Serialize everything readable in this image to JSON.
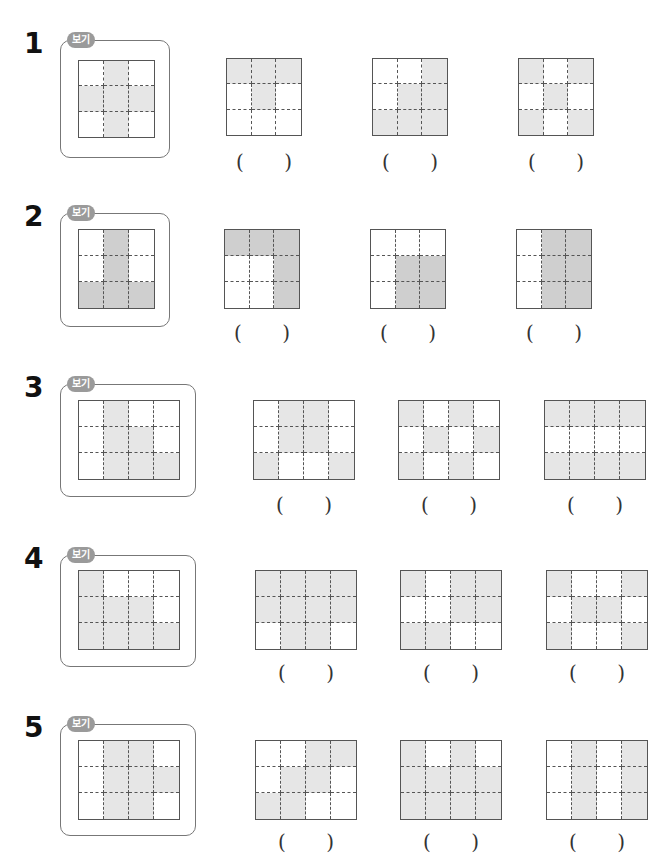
{
  "badge_label": "보기",
  "paren_open": "(",
  "paren_close": ")",
  "shade_color": "#e6e6e6",
  "shade_color_dark": "#cfcfcf",
  "problems": [
    {
      "number": "1",
      "rows": 3,
      "cols": 3,
      "example": [
        [
          0,
          1,
          0
        ],
        [
          1,
          1,
          1
        ],
        [
          0,
          1,
          0
        ]
      ],
      "options": [
        [
          [
            1,
            1,
            1
          ],
          [
            0,
            1,
            0
          ],
          [
            0,
            0,
            0
          ]
        ],
        [
          [
            0,
            0,
            1
          ],
          [
            0,
            1,
            1
          ],
          [
            1,
            1,
            1
          ]
        ],
        [
          [
            1,
            0,
            1
          ],
          [
            0,
            1,
            0
          ],
          [
            1,
            0,
            1
          ]
        ]
      ],
      "answers": [
        "",
        "",
        ""
      ]
    },
    {
      "number": "2",
      "rows": 3,
      "cols": 3,
      "example": [
        [
          0,
          1,
          0
        ],
        [
          0,
          1,
          0
        ],
        [
          1,
          1,
          1
        ]
      ],
      "options": [
        [
          [
            1,
            1,
            1
          ],
          [
            0,
            0,
            1
          ],
          [
            0,
            0,
            1
          ]
        ],
        [
          [
            0,
            0,
            0
          ],
          [
            0,
            1,
            1
          ],
          [
            0,
            1,
            1
          ]
        ],
        [
          [
            0,
            1,
            1
          ],
          [
            0,
            1,
            1
          ],
          [
            0,
            1,
            1
          ]
        ]
      ],
      "answers": [
        "",
        "",
        ""
      ]
    },
    {
      "number": "3",
      "rows": 3,
      "cols": 4,
      "example": [
        [
          0,
          1,
          0,
          0
        ],
        [
          0,
          1,
          1,
          0
        ],
        [
          0,
          1,
          1,
          1
        ]
      ],
      "options": [
        [
          [
            0,
            1,
            1,
            0
          ],
          [
            0,
            1,
            1,
            0
          ],
          [
            1,
            0,
            0,
            1
          ]
        ],
        [
          [
            1,
            0,
            1,
            0
          ],
          [
            0,
            1,
            0,
            1
          ],
          [
            1,
            0,
            1,
            0
          ]
        ],
        [
          [
            1,
            1,
            1,
            1
          ],
          [
            0,
            0,
            0,
            0
          ],
          [
            1,
            1,
            1,
            1
          ]
        ]
      ],
      "answers": [
        "",
        "",
        ""
      ]
    },
    {
      "number": "4",
      "rows": 3,
      "cols": 4,
      "example": [
        [
          1,
          0,
          0,
          0
        ],
        [
          1,
          1,
          1,
          0
        ],
        [
          1,
          1,
          1,
          1
        ]
      ],
      "options": [
        [
          [
            1,
            1,
            1,
            1
          ],
          [
            1,
            1,
            1,
            1
          ],
          [
            0,
            1,
            1,
            0
          ]
        ],
        [
          [
            1,
            0,
            1,
            1
          ],
          [
            0,
            0,
            1,
            1
          ],
          [
            1,
            1,
            0,
            0
          ]
        ],
        [
          [
            1,
            0,
            0,
            1
          ],
          [
            0,
            1,
            1,
            0
          ],
          [
            1,
            0,
            0,
            1
          ]
        ]
      ],
      "answers": [
        "",
        "",
        ""
      ]
    },
    {
      "number": "5",
      "rows": 3,
      "cols": 4,
      "example": [
        [
          0,
          1,
          1,
          0
        ],
        [
          0,
          1,
          1,
          1
        ],
        [
          0,
          1,
          1,
          0
        ]
      ],
      "options": [
        [
          [
            0,
            0,
            1,
            1
          ],
          [
            0,
            1,
            1,
            0
          ],
          [
            1,
            1,
            0,
            0
          ]
        ],
        [
          [
            1,
            0,
            1,
            0
          ],
          [
            1,
            1,
            1,
            1
          ],
          [
            1,
            1,
            1,
            1
          ]
        ],
        [
          [
            0,
            1,
            0,
            1
          ],
          [
            0,
            1,
            0,
            1
          ],
          [
            0,
            1,
            0,
            1
          ]
        ]
      ],
      "answers": [
        "",
        "",
        ""
      ]
    }
  ]
}
